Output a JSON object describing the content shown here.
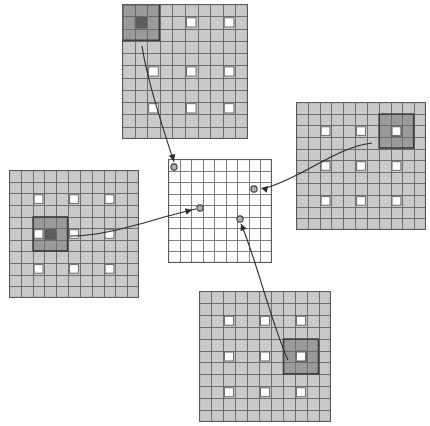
{
  "figure": {
    "type": "diagram",
    "canvas": {
      "width": 430,
      "height": 426
    },
    "background_color": "#ffffff"
  },
  "palette": {
    "grid_fill": "#c9c9c9",
    "grid_line": "#6e6e6e",
    "grid_line_minor": "#8f8f8f",
    "center_fill": "#ffffff",
    "center_line": "#7d7d7d",
    "unit_cell_fill": "#ffffff",
    "unit_cell_stroke": "#6e6e6e",
    "receptive_block_fill": "#9a9a9a",
    "receptive_block_stroke": "#3c3c3c",
    "receptive_core_fill": "#5e5e5e",
    "edge_stroke": "#2b2b2b",
    "node_fill": "#b0b0b0",
    "node_stroke": "#3c3c3c",
    "panel_border": "#5a5a5a"
  },
  "panels": [
    {
      "id": "panel-top",
      "name": "top-feature-map",
      "x": 122,
      "y": 4,
      "width": 126,
      "height": 135,
      "cols": 10,
      "rows": 11,
      "shaded": true,
      "unit_cells": [
        {
          "col": 5,
          "row": 1
        },
        {
          "col": 8,
          "row": 1
        },
        {
          "col": 2,
          "row": 5
        },
        {
          "col": 5,
          "row": 5
        },
        {
          "col": 8,
          "row": 5
        },
        {
          "col": 2,
          "row": 8
        },
        {
          "col": 5,
          "row": 8
        },
        {
          "col": 8,
          "row": 8
        }
      ],
      "receptive_block": {
        "col": 0,
        "row": 0,
        "span": 3,
        "core_col": 1,
        "core_row": 1
      }
    },
    {
      "id": "panel-left",
      "name": "left-feature-map",
      "x": 9,
      "y": 170,
      "width": 130,
      "height": 128,
      "cols": 11,
      "rows": 11,
      "shaded": true,
      "unit_cells": [
        {
          "col": 2,
          "row": 2
        },
        {
          "col": 5,
          "row": 2
        },
        {
          "col": 8,
          "row": 2
        },
        {
          "col": 2,
          "row": 5
        },
        {
          "col": 5,
          "row": 5
        },
        {
          "col": 8,
          "row": 5
        },
        {
          "col": 2,
          "row": 8
        },
        {
          "col": 5,
          "row": 8
        },
        {
          "col": 8,
          "row": 8
        }
      ],
      "receptive_block": {
        "col": 2,
        "row": 4,
        "span": 3,
        "core_col": 3,
        "core_row": 5
      }
    },
    {
      "id": "panel-right",
      "name": "right-feature-map",
      "x": 296,
      "y": 102,
      "width": 130,
      "height": 128,
      "cols": 11,
      "rows": 11,
      "shaded": true,
      "unit_cells": [
        {
          "col": 2,
          "row": 2
        },
        {
          "col": 5,
          "row": 2
        },
        {
          "col": 8,
          "row": 2
        },
        {
          "col": 2,
          "row": 5
        },
        {
          "col": 5,
          "row": 5
        },
        {
          "col": 8,
          "row": 5
        },
        {
          "col": 2,
          "row": 8
        },
        {
          "col": 5,
          "row": 8
        },
        {
          "col": 8,
          "row": 8
        }
      ],
      "receptive_block": {
        "col": 7,
        "row": 1,
        "span": 3,
        "core_col": 8,
        "core_row": 2
      }
    },
    {
      "id": "panel-bottom",
      "name": "bottom-feature-map",
      "x": 199,
      "y": 291,
      "width": 132,
      "height": 131,
      "cols": 11,
      "rows": 11,
      "shaded": true,
      "unit_cells": [
        {
          "col": 2,
          "row": 2
        },
        {
          "col": 5,
          "row": 2
        },
        {
          "col": 8,
          "row": 2
        },
        {
          "col": 2,
          "row": 5
        },
        {
          "col": 5,
          "row": 5
        },
        {
          "col": 8,
          "row": 5
        },
        {
          "col": 2,
          "row": 8
        },
        {
          "col": 5,
          "row": 8
        },
        {
          "col": 8,
          "row": 8
        }
      ],
      "receptive_block": {
        "col": 7,
        "row": 4,
        "span": 3,
        "core_col": 8,
        "core_row": 5
      }
    },
    {
      "id": "panel-center",
      "name": "center-feature-map",
      "x": 168,
      "y": 159,
      "width": 104,
      "height": 104,
      "cols": 9,
      "rows": 9,
      "shaded": false,
      "unit_cells": [],
      "receptive_block": null
    }
  ],
  "edges": [
    {
      "id": "edge-top",
      "name": "link-top-to-center",
      "from_panel": "panel-top",
      "to_panel": "panel-center",
      "path": "M 142 46 C 146 74, 160 120, 174 162",
      "node": {
        "x": 174,
        "y": 167
      },
      "arrow": {
        "x": 174,
        "y": 161,
        "angle": 72
      }
    },
    {
      "id": "edge-left",
      "name": "link-left-to-center",
      "from_panel": "panel-left",
      "to_panel": "panel-center",
      "path": "M 70 236 C 112 236, 154 218, 196 209",
      "node": {
        "x": 200,
        "y": 208
      },
      "arrow": {
        "x": 192,
        "y": 210,
        "angle": -14
      }
    },
    {
      "id": "edge-right",
      "name": "link-right-to-center",
      "from_panel": "panel-right",
      "to_panel": "panel-center",
      "path": "M 372 143 C 334 148, 306 176, 266 188",
      "node": {
        "x": 254,
        "y": 189
      },
      "arrow": {
        "x": 261,
        "y": 188,
        "angle": 192
      }
    },
    {
      "id": "edge-bottom",
      "name": "link-bottom-to-center",
      "from_panel": "panel-bottom",
      "to_panel": "panel-center",
      "path": "M 288 360 C 272 326, 256 258, 241 224",
      "node": {
        "x": 240,
        "y": 219
      },
      "arrow": {
        "x": 241,
        "y": 224,
        "angle": -114
      }
    }
  ]
}
